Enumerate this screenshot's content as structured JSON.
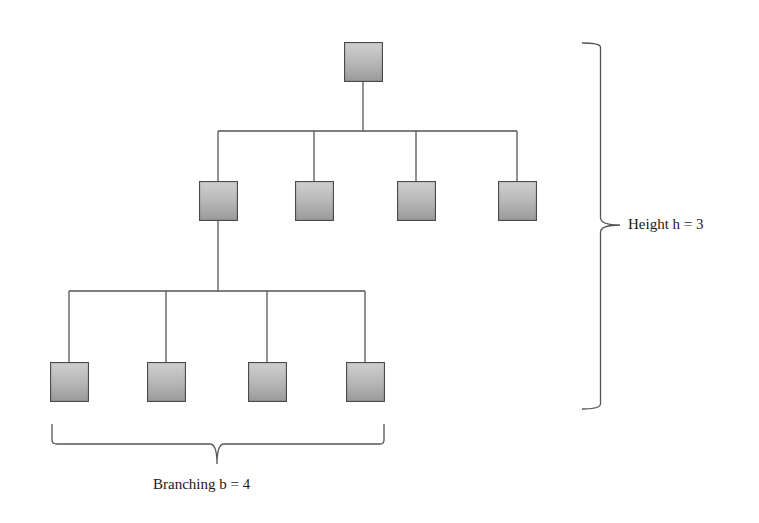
{
  "diagram": {
    "labels": {
      "height": "Height h = 3",
      "branching": "Branching b = 4"
    },
    "colors": {
      "node_fill_top": "#cfcfcf",
      "node_fill_bottom": "#9a9a9a",
      "node_border": "#4a4a4a",
      "line": "#555555",
      "text": "#1a1a1a"
    },
    "levels": [
      {
        "level": 0,
        "nodes": [
          {
            "id": "root",
            "x": 344,
            "y": 42
          }
        ]
      },
      {
        "level": 1,
        "bar_y": 131,
        "nodes": [
          {
            "id": "l1-1",
            "x": 199,
            "y": 181
          },
          {
            "id": "l1-2",
            "x": 295,
            "y": 181
          },
          {
            "id": "l1-3",
            "x": 397,
            "y": 181
          },
          {
            "id": "l1-4",
            "x": 498,
            "y": 181
          }
        ]
      },
      {
        "level": 2,
        "bar_y": 291,
        "nodes": [
          {
            "id": "l2-1",
            "x": 50,
            "y": 362
          },
          {
            "id": "l2-2",
            "x": 147,
            "y": 362
          },
          {
            "id": "l2-3",
            "x": 248,
            "y": 362
          },
          {
            "id": "l2-4",
            "x": 346,
            "y": 362
          }
        ]
      }
    ]
  }
}
